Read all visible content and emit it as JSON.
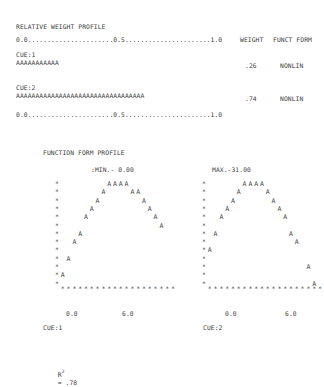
{
  "relative_weight_profile": {
    "title": "RELATIVE WEIGHT PROFILE",
    "scale_line": "0.0......................0.5......................1.0",
    "col_weight": "WEIGHT",
    "col_funct_form": "FUNCT FORM",
    "cues": [
      {
        "label": "CUE:1",
        "bar": "AAAAAAAAAAA",
        "weight": ".26",
        "funct_form": "NONLIN"
      },
      {
        "label": "CUE:2",
        "bar": "AAAAAAAAAAAAAAAAAAAAAAAAAAAAAAAAA",
        "weight": ".74",
        "funct_form": "NONLIN"
      }
    ],
    "scale_line_bottom": "0.0......................0.5......................1.0"
  },
  "function_form_profile": {
    "title": "FUNCTION FORM PROFILE",
    "min_label": ":MIN.- 0.00",
    "max_label": "MAX.-31.00",
    "plots": [
      {
        "cue_label": "CUE:1",
        "x_min": "0.0",
        "x_max": "6.0"
      },
      {
        "cue_label": "CUE:2",
        "x_min": "0.0",
        "x_max": "6.0"
      }
    ]
  },
  "r_squared": {
    "label": "R",
    "exponent": "2",
    "value": "= .78"
  },
  "chart_data": [
    {
      "type": "scatter",
      "title": "FUNCTION FORM PROFILE - CUE:1",
      "xlabel": "CUE:1",
      "x_ticks": [
        "0.0",
        "6.0"
      ],
      "xlim": [
        0.0,
        6.0
      ],
      "ylim": [
        0.0,
        31.0
      ],
      "annotations": [
        ":MIN.- 0.00"
      ],
      "shape": "inverted-U",
      "points_col_row": [
        [
          1,
          12
        ],
        [
          2,
          10
        ],
        [
          3,
          8
        ],
        [
          4,
          7
        ],
        [
          5,
          5
        ],
        [
          6,
          4
        ],
        [
          7,
          3
        ],
        [
          8,
          2
        ],
        [
          9,
          1
        ],
        [
          10,
          1
        ],
        [
          11,
          1
        ],
        [
          12,
          1
        ],
        [
          13,
          2
        ],
        [
          14,
          2
        ],
        [
          15,
          3
        ],
        [
          16,
          4
        ],
        [
          17,
          5
        ],
        [
          18,
          6
        ]
      ]
    },
    {
      "type": "scatter",
      "title": "FUNCTION FORM PROFILE - CUE:2",
      "xlabel": "CUE:2",
      "x_ticks": [
        "0.0",
        "6.0"
      ],
      "xlim": [
        0.0,
        6.0
      ],
      "ylim": [
        0.0,
        31.0
      ],
      "annotations": [
        "MAX.-31.00"
      ],
      "shape": "inverted-U",
      "points_col_row": [
        [
          1,
          9
        ],
        [
          2,
          7
        ],
        [
          3,
          5
        ],
        [
          4,
          4
        ],
        [
          5,
          3
        ],
        [
          6,
          2
        ],
        [
          7,
          1
        ],
        [
          8,
          1
        ],
        [
          9,
          1
        ],
        [
          10,
          1
        ],
        [
          11,
          2
        ],
        [
          12,
          3
        ],
        [
          13,
          4
        ],
        [
          14,
          5
        ],
        [
          15,
          7
        ],
        [
          16,
          8
        ],
        [
          18,
          11
        ],
        [
          19,
          13
        ]
      ]
    }
  ]
}
